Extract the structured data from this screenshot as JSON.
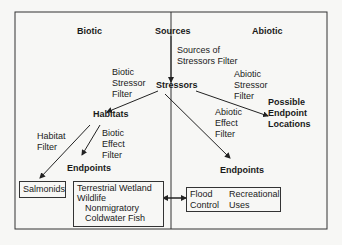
{
  "diagram": {
    "headers": {
      "biotic": "Biotic",
      "sources": "Sources",
      "abiotic": "Abiotic"
    },
    "filters": {
      "sources_of_stressors": [
        "Sources of",
        "Stressors Filter"
      ],
      "biotic_stressor": [
        "Biotic",
        "Stressor",
        "Filter"
      ],
      "abiotic_stressor": [
        "Abiotic",
        "Stressor",
        "Filter"
      ],
      "habitat": [
        "Habitat",
        "Filter"
      ],
      "biotic_effect": [
        "Biotic",
        "Effect",
        "Filter"
      ],
      "abiotic_effect": [
        "Abiotic",
        "Effect",
        "Filter"
      ]
    },
    "nodes": {
      "stressors": "Stressors",
      "habitats": "Habitats",
      "possible_endpoint_locations": [
        "Possible",
        "Endpoint",
        "Locations"
      ],
      "endpoints_biotic": "Endpoints",
      "endpoints_abiotic": "Endpoints"
    },
    "boxes": {
      "salmonids": "Salmonids",
      "biotic_endpoints": [
        "Terrestrial Wetland",
        "Wildlife",
        "Nonmigratory",
        "Coldwater Fish"
      ],
      "abiotic_endpoints": {
        "col1": [
          "Flood",
          "Control"
        ],
        "col2": [
          "Recreational",
          "Uses"
        ]
      }
    }
  }
}
